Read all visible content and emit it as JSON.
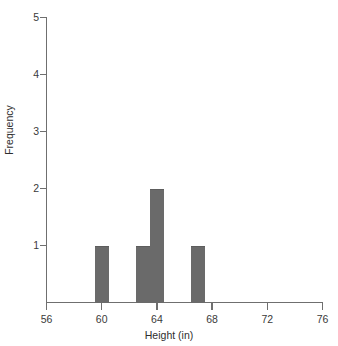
{
  "chart_data": {
    "type": "bar",
    "title": "",
    "subtitle": "",
    "xlabel": "Height (in)",
    "ylabel": "Frequency",
    "xlim": [
      56,
      76
    ],
    "ylim": [
      0,
      5
    ],
    "xticks": [
      56,
      60,
      64,
      68,
      72,
      76
    ],
    "yticks": [
      1,
      2,
      3,
      4,
      5
    ],
    "xtick_labels": [
      "56",
      "60",
      "64",
      "68",
      "72",
      "76"
    ],
    "ytick_labels": [
      "1",
      "2",
      "3",
      "4",
      "5"
    ],
    "grid": false,
    "legend": false,
    "legend_position": "none",
    "bin_width": 1,
    "bins": [
      {
        "label": "59.5-60.5",
        "x_left": 59.5,
        "x_right": 60.5,
        "value": 1
      },
      {
        "label": "62.5-63.5",
        "x_left": 62.5,
        "x_right": 63.5,
        "value": 1
      },
      {
        "label": "63.5-64.5",
        "x_left": 63.5,
        "x_right": 64.5,
        "value": 2
      },
      {
        "label": "66.5-67.5",
        "x_left": 66.5,
        "x_right": 67.5,
        "value": 1
      }
    ],
    "categories": [
      "59.5-60.5",
      "62.5-63.5",
      "63.5-64.5",
      "66.5-67.5"
    ],
    "values": [
      1,
      1,
      2,
      1
    ],
    "bar_color": "#6a6a6a",
    "axis_color": "#6f6f6f",
    "background_color": "#ffffff"
  }
}
